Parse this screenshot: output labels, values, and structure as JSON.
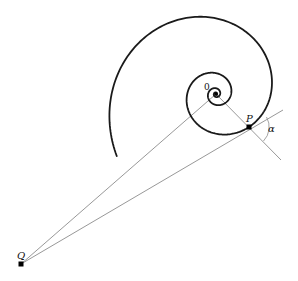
{
  "diagram": {
    "type": "logarithmic-spiral",
    "colors": {
      "background": "#ffffff",
      "spiral": "#1a1a1a",
      "lines": "#8c8c8c",
      "points": "#000000"
    },
    "spiral": {
      "center": [
        216,
        94
      ],
      "anchor_point": [
        249,
        127
      ],
      "growth_k": 0.205,
      "theta_start_deg": -1000,
      "theta_end_deg": 148,
      "stroke_width": 1.8
    },
    "points": {
      "O": {
        "label": "0",
        "x": 216,
        "y": 94
      },
      "P": {
        "label": "P",
        "x": 249,
        "y": 127
      },
      "Q": {
        "label": "Q",
        "x": 21,
        "y": 264
      }
    },
    "lines": [
      {
        "name": "radial-line-OP",
        "from": [
          216,
          94
        ],
        "to": [
          281,
          160
        ]
      },
      {
        "name": "line-QO",
        "from": [
          21,
          264
        ],
        "to": [
          216,
          94
        ]
      },
      {
        "name": "tangent-line-QP",
        "from": [
          21,
          264
        ],
        "to": [
          283,
          110
        ]
      }
    ],
    "angle_marker": {
      "label": "α",
      "center": [
        249,
        127
      ],
      "radius": 20
    },
    "labels": {
      "O": "0",
      "P": "P",
      "Q": "Q",
      "alpha": "α"
    }
  }
}
